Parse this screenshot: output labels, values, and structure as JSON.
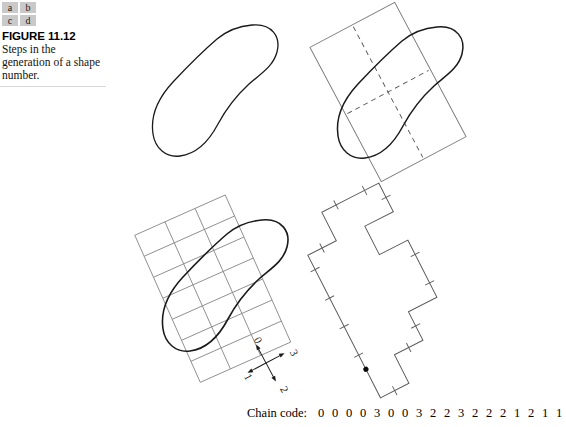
{
  "caption": {
    "panel_key_rows": [
      [
        "a",
        "b"
      ],
      [
        "c",
        "d"
      ]
    ],
    "figure_number": "FIGURE 11.12",
    "text": "Steps in the generation of a shape number."
  },
  "chain_code": {
    "label": "Chain code:",
    "digits": [
      "0",
      "0",
      "0",
      "0",
      "3",
      "0",
      "0",
      "3",
      "2",
      "2",
      "3",
      "2",
      "2",
      "2",
      "1",
      "2",
      "1",
      "1"
    ]
  },
  "direction_axes": {
    "labels": [
      "0",
      "1",
      "2",
      "3"
    ],
    "rotation_deg": -28
  },
  "panels": {
    "a": {
      "name": "original-boundary",
      "description": "Original pear-shaped boundary"
    },
    "b": {
      "name": "boundary-with-major-minor-axes",
      "description": "Boundary with rotated basic rectangle and dashed major and minor axes"
    },
    "c": {
      "name": "boundary-with-grid",
      "description": "Boundary overlaid with rotated sampling grid",
      "grid_cols": 3,
      "grid_rows": 7
    },
    "d": {
      "name": "chain-coded-polygon",
      "description": "Resampled chain-coded boundary polygon with start point marker"
    }
  },
  "colors": {
    "ink": "#1a1a1a",
    "thin_line": "#6f6f6f",
    "grid_line": "#8a8a8a",
    "key_fill": "#c9c9c9",
    "rule": "#d8d8d8"
  },
  "chart_data": {
    "type": "line",
    "title": "Steps in the generation of a shape number",
    "series": [
      {
        "name": "chain-code-sequence",
        "values": [
          0,
          0,
          0,
          0,
          3,
          0,
          0,
          3,
          2,
          2,
          3,
          2,
          2,
          2,
          1,
          2,
          1,
          1
        ]
      }
    ],
    "categories": [
      "s1",
      "s2",
      "s3",
      "s4",
      "s5",
      "s6",
      "s7",
      "s8",
      "s9",
      "s10",
      "s11",
      "s12",
      "s13",
      "s14",
      "s15",
      "s16",
      "s17",
      "s18"
    ],
    "xlabel": "",
    "ylabel": "",
    "ylim": [
      0,
      3
    ],
    "legend": "none",
    "grid": false
  }
}
